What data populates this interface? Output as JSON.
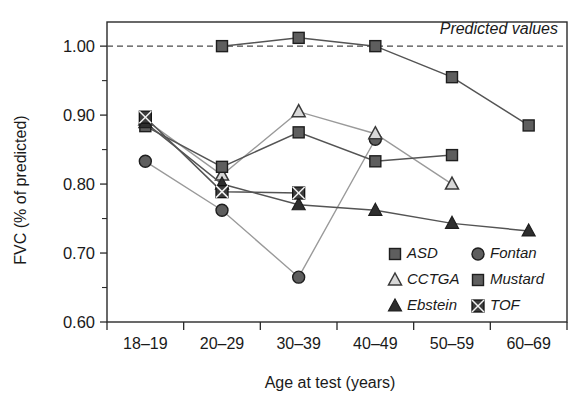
{
  "chart_data": {
    "type": "line",
    "title": "",
    "xlabel": "Age at test (years)",
    "ylabel": "FVC (% of predicted)",
    "categories": [
      "18–19",
      "20–29",
      "30–39",
      "40–49",
      "50–59",
      "60–69"
    ],
    "ylim": [
      0.6,
      1.0
    ],
    "yticks": [
      "0.60",
      "0.70",
      "0.80",
      "0.90",
      "1.00"
    ],
    "ytick_values": [
      0.6,
      0.7,
      0.8,
      0.9,
      1.0
    ],
    "yminor_step": 0.05,
    "grid": false,
    "legend_position": "lower-right-inside",
    "annotations": [
      {
        "text": "Predicted values",
        "value": 1.0,
        "style": "italic",
        "position": "top-right"
      }
    ],
    "reference_line": {
      "value": 1.0,
      "style": "dashed",
      "label": "Predicted values"
    },
    "series": [
      {
        "name": "ASD",
        "marker": "square",
        "x": [
          "20–29",
          "30–39",
          "40–49",
          "50–59",
          "60–69"
        ],
        "values": [
          1.0,
          1.012,
          1.0,
          0.955,
          0.885
        ]
      },
      {
        "name": "Fontan",
        "marker": "circle",
        "x": [
          "18–19",
          "20–29",
          "30–39",
          "40–49"
        ],
        "values": [
          0.833,
          0.762,
          0.665,
          0.865
        ]
      },
      {
        "name": "CCTGA",
        "marker": "triangle-open",
        "x": [
          "18–19",
          "20–29",
          "30–39",
          "40–49",
          "50–59"
        ],
        "values": [
          0.893,
          0.813,
          0.905,
          0.873,
          0.8
        ]
      },
      {
        "name": "Mustard",
        "marker": "square",
        "x": [
          "18–19",
          "20–29",
          "30–39",
          "40–49",
          "50–59"
        ],
        "values": [
          0.884,
          0.825,
          0.875,
          0.833,
          0.842
        ]
      },
      {
        "name": "Ebstein",
        "marker": "triangle-filled",
        "x": [
          "18–19",
          "20–29",
          "30–39",
          "40–49",
          "50–59",
          "60–69"
        ],
        "values": [
          0.889,
          0.8,
          0.77,
          0.762,
          0.743,
          0.732
        ]
      },
      {
        "name": "TOF",
        "marker": "square-crossed",
        "x": [
          "18–19",
          "20–29",
          "30–39"
        ],
        "values": [
          0.897,
          0.789,
          0.787
        ]
      }
    ]
  },
  "axis": {
    "y_label": "FVC (% of predicted)",
    "x_label": "Age at test (years)",
    "y_ticks": [
      "1.00",
      "0.90",
      "0.80",
      "0.70",
      "0.60"
    ],
    "x_ticks": [
      "18–19",
      "20–29",
      "30–39",
      "40–49",
      "50–59",
      "60–69"
    ]
  },
  "annotation": {
    "predicted": "Predicted values"
  },
  "legend": {
    "items": [
      {
        "label": "ASD",
        "marker": "square"
      },
      {
        "label": "Fontan",
        "marker": "circle"
      },
      {
        "label": "CCTGA",
        "marker": "triangle-open"
      },
      {
        "label": "Mustard",
        "marker": "square"
      },
      {
        "label": "Ebstein",
        "marker": "triangle-filled"
      },
      {
        "label": "TOF",
        "marker": "square-crossed"
      }
    ]
  },
  "colors": {
    "marker_fill": "#5e5e5e",
    "marker_stroke": "#1e1e1e",
    "line": "#545454",
    "line_light": "#9a9a9a",
    "axis": "#2a2a2a",
    "background": "#ffffff"
  }
}
